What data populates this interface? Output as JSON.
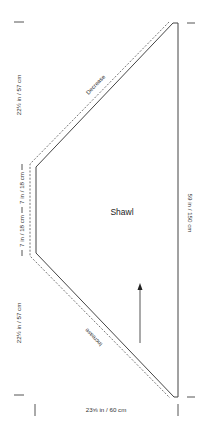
{
  "diagram": {
    "title": "Shawl",
    "colors": {
      "outline": "#444444",
      "dashed": "#555555",
      "text": "#333333",
      "tick": "#555555"
    },
    "shaping_labels": {
      "top_edge": "Decrease",
      "bottom_edge": "Increase"
    },
    "dimensions": {
      "left_top_section": "22½ in / 57 cm",
      "left_middle_upper": "7 in / 18 cm",
      "left_middle_lower": "7 in / 18 cm",
      "left_bottom_section": "22½ in / 57 cm",
      "right_full_length": "59 in / 150 cm",
      "bottom_width": "23⅝ in / 60 cm"
    },
    "direction_arrow": "knitting-direction-up"
  }
}
